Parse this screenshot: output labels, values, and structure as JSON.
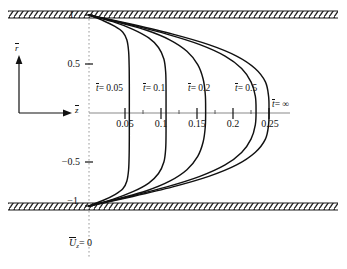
{
  "figure": {
    "bottom_caption": "U",
    "bottom_caption_sub": "z",
    "bottom_caption_eq": "= 0",
    "axis_r_label": "r",
    "axis_z_label": "z",
    "wall_top_label": "1",
    "wall_bottom_label": "−1"
  },
  "chart_data": {
    "type": "line",
    "title": "",
    "xlabel": "z̄",
    "ylabel": "r̄",
    "xlim": [
      0,
      0.27
    ],
    "ylim": [
      -1,
      1
    ],
    "grid": false,
    "legend": "inline-annotations",
    "x_ticks": [
      0.05,
      0.1,
      0.15,
      0.2,
      0.25
    ],
    "x_tick_labels": [
      "0.05",
      "0.1",
      "0.15",
      "0.2",
      "0.25"
    ],
    "y_ticks": [
      1,
      0.5,
      -0.5,
      -1
    ],
    "y_tick_labels": [
      "1",
      "0.5",
      "−0.5",
      "−1"
    ],
    "minor_x_ticks": [
      0.075,
      0.125,
      0.175,
      0.225
    ],
    "series": [
      {
        "name": "t̄ = 0.05",
        "label": "0.05",
        "centerline_value": 0.056,
        "points": [
          [
            0.0,
            1.0
          ],
          [
            0.02,
            0.94
          ],
          [
            0.036,
            0.88
          ],
          [
            0.047,
            0.82
          ],
          [
            0.0525,
            0.74
          ],
          [
            0.055,
            0.62
          ],
          [
            0.0558,
            0.45
          ],
          [
            0.056,
            0.25
          ],
          [
            0.056,
            0.0
          ],
          [
            0.056,
            -0.25
          ],
          [
            0.0558,
            -0.45
          ],
          [
            0.055,
            -0.62
          ],
          [
            0.0525,
            -0.74
          ],
          [
            0.047,
            -0.82
          ],
          [
            0.036,
            -0.88
          ],
          [
            0.02,
            -0.94
          ],
          [
            0.0,
            -1.0
          ]
        ]
      },
      {
        "name": "t̄ = 0.1",
        "label": "0.1",
        "centerline_value": 0.107,
        "points": [
          [
            0.0,
            1.0
          ],
          [
            0.033,
            0.93
          ],
          [
            0.061,
            0.85
          ],
          [
            0.083,
            0.76
          ],
          [
            0.0965,
            0.66
          ],
          [
            0.104,
            0.54
          ],
          [
            0.1065,
            0.4
          ],
          [
            0.107,
            0.22
          ],
          [
            0.107,
            0.0
          ],
          [
            0.107,
            -0.22
          ],
          [
            0.1065,
            -0.4
          ],
          [
            0.104,
            -0.54
          ],
          [
            0.0965,
            -0.66
          ],
          [
            0.083,
            -0.76
          ],
          [
            0.061,
            -0.85
          ],
          [
            0.033,
            -0.93
          ],
          [
            0.0,
            -1.0
          ]
        ]
      },
      {
        "name": "t̄ = 0.2",
        "label": "0.2",
        "centerline_value": 0.162,
        "points": [
          [
            0.0,
            1.0
          ],
          [
            0.042,
            0.92
          ],
          [
            0.08,
            0.84
          ],
          [
            0.112,
            0.74
          ],
          [
            0.136,
            0.62
          ],
          [
            0.151,
            0.48
          ],
          [
            0.1585,
            0.33
          ],
          [
            0.1615,
            0.17
          ],
          [
            0.162,
            0.0
          ],
          [
            0.1615,
            -0.17
          ],
          [
            0.1585,
            -0.33
          ],
          [
            0.151,
            -0.48
          ],
          [
            0.136,
            -0.62
          ],
          [
            0.112,
            -0.74
          ],
          [
            0.08,
            -0.84
          ],
          [
            0.042,
            -0.92
          ],
          [
            0.0,
            -1.0
          ]
        ]
      },
      {
        "name": "t̄ = 0.5",
        "label": "0.5",
        "centerline_value": 0.232,
        "points": [
          [
            0.0,
            1.0
          ],
          [
            0.056,
            0.9
          ],
          [
            0.108,
            0.8
          ],
          [
            0.154,
            0.69
          ],
          [
            0.189,
            0.57
          ],
          [
            0.212,
            0.44
          ],
          [
            0.225,
            0.3
          ],
          [
            0.231,
            0.15
          ],
          [
            0.232,
            0.0
          ],
          [
            0.231,
            -0.15
          ],
          [
            0.225,
            -0.3
          ],
          [
            0.212,
            -0.44
          ],
          [
            0.189,
            -0.57
          ],
          [
            0.154,
            -0.69
          ],
          [
            0.108,
            -0.8
          ],
          [
            0.056,
            -0.9
          ],
          [
            0.0,
            -1.0
          ]
        ]
      },
      {
        "name": "t̄ = ∞",
        "label": "∞",
        "centerline_value": 0.25,
        "points": [
          [
            0.0,
            1.0
          ],
          [
            0.0609,
            0.9
          ],
          [
            0.1163,
            0.8
          ],
          [
            0.1663,
            0.69
          ],
          [
            0.205,
            0.57
          ],
          [
            0.2307,
            0.44
          ],
          [
            0.245,
            0.3
          ],
          [
            0.2494,
            0.15
          ],
          [
            0.25,
            0.0
          ],
          [
            0.2494,
            -0.15
          ],
          [
            0.245,
            -0.3
          ],
          [
            0.2307,
            -0.44
          ],
          [
            0.205,
            -0.57
          ],
          [
            0.1663,
            -0.69
          ],
          [
            0.1163,
            -0.8
          ],
          [
            0.0609,
            -0.9
          ],
          [
            0.0,
            -1.0
          ]
        ]
      }
    ],
    "annotations": [
      {
        "text_var": "t",
        "text_eq": "= 0.05",
        "x": 0.043,
        "y": 0.3
      },
      {
        "text_var": "t",
        "text_eq": "= 0.1",
        "x": 0.095,
        "y": 0.3
      },
      {
        "text_var": "t",
        "text_eq": "= 0.2",
        "x": 0.15,
        "y": 0.3
      },
      {
        "text_var": "t",
        "text_eq": "= 0.5",
        "x": 0.21,
        "y": 0.3
      },
      {
        "text_var": "t",
        "text_eq": "= ∞",
        "x": 0.252,
        "y": 0.13
      }
    ]
  },
  "labels": {
    "curve_var": "t",
    "c1_eq": "= 0.05",
    "c2_eq": "= 0.1",
    "c3_eq": "= 0.2",
    "c4_eq": "= 0.5",
    "c5_eq": "= ∞",
    "y_top": "1",
    "y_half": "0.5",
    "y_neg_half": "−0.5",
    "y_neg_one": "−1",
    "x1": "0.05",
    "x2": "0.1",
    "x3": "0.15",
    "x4": "0.2",
    "x5": "0.25",
    "axis_r": "r",
    "axis_z": "z",
    "cap_u": "U",
    "cap_sub": "z",
    "cap_eq": "= 0"
  },
  "colors": {
    "curve": "#111111",
    "wall": "#1a1a1a",
    "axis": "#808080",
    "centerline": "#9a9a9a",
    "text": "#111111",
    "background": "#ffffff"
  }
}
